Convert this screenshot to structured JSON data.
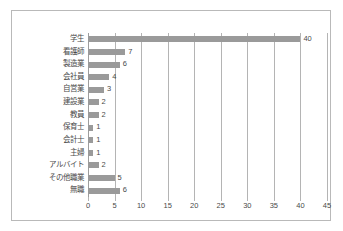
{
  "chart_data": {
    "type": "bar",
    "orientation": "horizontal",
    "title": "",
    "xlabel": "",
    "ylabel": "",
    "categories": [
      "学生",
      "看護師",
      "製造業",
      "会社員",
      "自営業",
      "建設業",
      "教員",
      "保育士",
      "会計士",
      "主婦",
      "アルバイト",
      "その他職業",
      "無職"
    ],
    "values": [
      40,
      7,
      6,
      4,
      3,
      2,
      2,
      1,
      1,
      1,
      2,
      5,
      6
    ],
    "value_labels": [
      "40",
      "7",
      "6",
      "4",
      "3",
      "2",
      "2",
      "1",
      "1",
      "1",
      "2",
      "5",
      "6"
    ],
    "xlim": [
      0,
      45
    ],
    "xticks": [
      0,
      5,
      10,
      15,
      20,
      25,
      30,
      35,
      40,
      45
    ],
    "xtick_labels": [
      "0",
      "5",
      "10",
      "15",
      "20",
      "25",
      "30",
      "35",
      "40",
      "45"
    ],
    "grid": "vertical",
    "legend": "none",
    "bar_color": "#9a9a9a",
    "gridline_color": "#b4b4b4",
    "frame_color": "#b9b9b9",
    "background_color": "#ffffff",
    "text_color": "#4a4a4a"
  }
}
